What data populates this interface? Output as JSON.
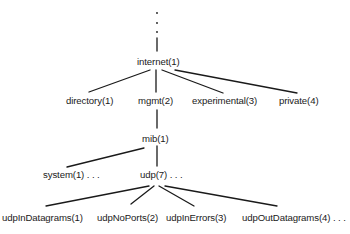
{
  "diagram": {
    "type": "tree",
    "title": "",
    "colors": {
      "line": "#1a1a1a",
      "text": "#1a1a1a",
      "background": "#ffffff"
    },
    "root_ellipsis": ". . .",
    "nodes": {
      "internet": "internet(1)",
      "directory": "directory(1)",
      "mgmt": "mgmt(2)",
      "experimental": "experimental(3)",
      "private": "private(4)",
      "mib": "mib(1)",
      "system": "system(1) . . .",
      "udp": "udp(7) . . .",
      "udpInDatagrams": "udpInDatagrams(1)",
      "udpNoPorts": "udpNoPorts(2)",
      "udpInErrors": "udpInErrors(3)",
      "udpOutDatagrams": "udpOutDatagrams(4) . . ."
    },
    "edges": [
      [
        "root",
        "internet"
      ],
      [
        "internet",
        "directory"
      ],
      [
        "internet",
        "mgmt"
      ],
      [
        "internet",
        "experimental"
      ],
      [
        "internet",
        "private"
      ],
      [
        "mgmt",
        "mib"
      ],
      [
        "mib",
        "system"
      ],
      [
        "mib",
        "udp"
      ],
      [
        "udp",
        "udpInDatagrams"
      ],
      [
        "udp",
        "udpNoPorts"
      ],
      [
        "udp",
        "udpInErrors"
      ],
      [
        "udp",
        "udpOutDatagrams"
      ]
    ]
  }
}
